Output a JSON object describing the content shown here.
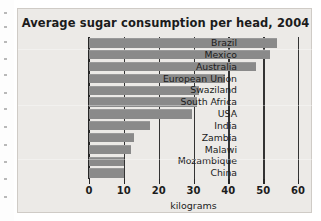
{
  "figure": {
    "title": "Average sugar consumption per head, 2004",
    "panel_color": "#eceae7",
    "bar_color": "#8a8a8a",
    "axis_color": "#262626"
  },
  "chart_data": {
    "type": "bar",
    "orientation": "horizontal",
    "title": "Average sugar consumption per head, 2004",
    "xlabel": "kilograms",
    "ylabel": "",
    "xlim": [
      0,
      60
    ],
    "xticks": [
      0,
      10,
      20,
      30,
      40,
      50,
      60
    ],
    "xtick_labels": [
      "0",
      "10",
      "20",
      "30",
      "40",
      "50",
      "60"
    ],
    "grid": true,
    "legend": null,
    "categories": [
      "Brazil",
      "Mexico",
      "Australia",
      "European Union",
      "Swaziland",
      "South Africa",
      "USA",
      "India",
      "Zambia",
      "Malawi",
      "Mozambique",
      "China"
    ],
    "values": [
      54,
      52,
      48,
      39,
      31.5,
      31,
      29.5,
      17.5,
      13,
      12,
      10,
      10
    ],
    "units": "kilograms"
  }
}
